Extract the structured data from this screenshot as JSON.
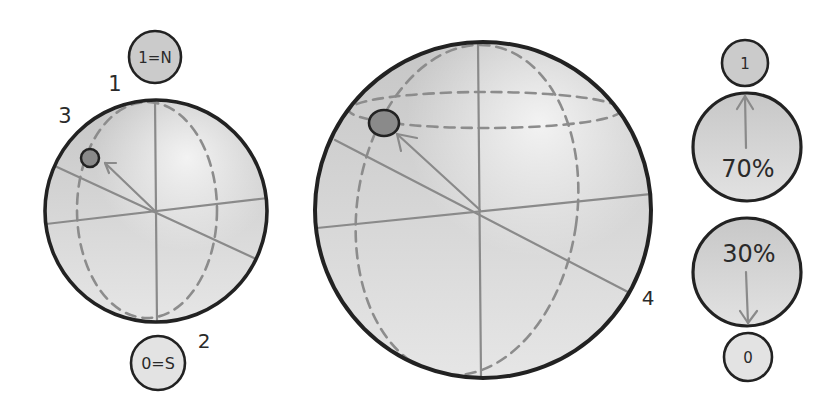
{
  "left_sphere": {
    "north_pole_label": "1=N",
    "south_pole_label": "0=S",
    "annotations": {
      "north": "1",
      "south": "2",
      "state": "3"
    }
  },
  "right_sphere": {
    "annotation": "4"
  },
  "measurement": {
    "outcome_one": {
      "label": "1"
    },
    "upper_ball": {
      "percent": "70%"
    },
    "lower_ball": {
      "percent": "30%"
    },
    "outcome_zero": {
      "label": "0"
    }
  },
  "colors": {
    "background": "#ffffff",
    "outline": "#222222",
    "axis_line": "#8a8a8a",
    "dashed_line": "#8c8c8c",
    "state_dot": "#8a8a8a",
    "sphere_top": "#c6c6c6",
    "sphere_bottom": "#e6e6e6",
    "highlight": "#ffffff",
    "label_circle_dark": "#cbcbcb",
    "label_circle_light": "#e3e3e3",
    "ball_top": "#c7c7c7",
    "ball_bottom": "#e2e2e2",
    "text": "#2a2a2a"
  }
}
